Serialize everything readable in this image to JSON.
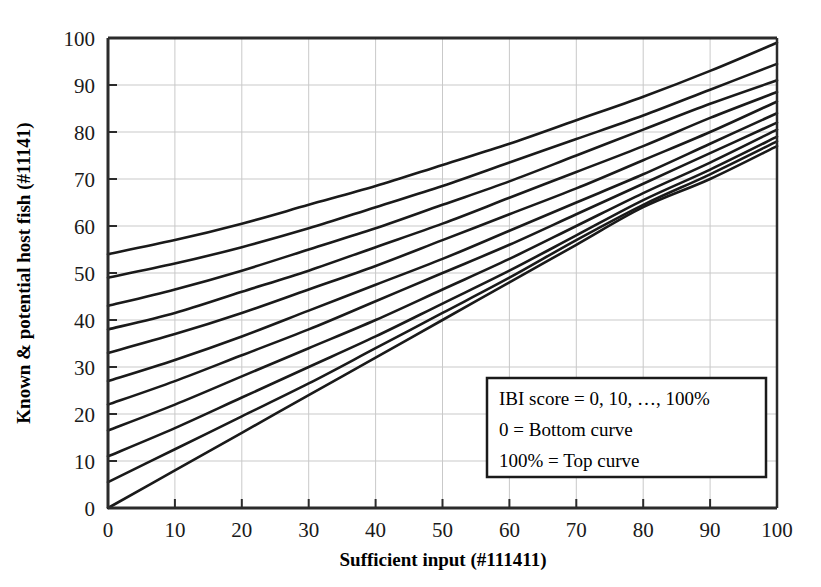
{
  "chart_data": {
    "type": "line",
    "title": "",
    "subtitle": "",
    "xlabel": "Sufficient input (#111411)",
    "ylabel": "Known & potential host fish (#11141)",
    "xlim": [
      0,
      100
    ],
    "ylim": [
      0,
      100
    ],
    "xticks": [
      "0",
      "10",
      "20",
      "30",
      "40",
      "50",
      "60",
      "70",
      "80",
      "90",
      "100"
    ],
    "yticks": [
      "0",
      "10",
      "20",
      "30",
      "40",
      "50",
      "60",
      "70",
      "80",
      "90",
      "100"
    ],
    "grid": true,
    "legend_position": "inside-bottom-right",
    "x": [
      0,
      10,
      20,
      30,
      40,
      50,
      60,
      70,
      80,
      90,
      100
    ],
    "series": [
      {
        "name": "IBI 0%",
        "values": [
          0,
          8,
          16,
          24,
          32,
          40,
          48,
          56,
          64,
          70,
          77
        ]
      },
      {
        "name": "IBI 10%",
        "values": [
          5.5,
          12.5,
          19.5,
          26.5,
          34,
          41.5,
          49,
          57,
          64.5,
          71,
          78
        ]
      },
      {
        "name": "IBI 20%",
        "values": [
          11,
          17,
          23.5,
          30,
          36.5,
          43.5,
          50.5,
          58,
          65.5,
          72,
          79
        ]
      },
      {
        "name": "IBI 30%",
        "values": [
          16.5,
          22,
          28,
          34,
          40,
          46.5,
          53,
          60,
          67,
          73.5,
          80.5
        ]
      },
      {
        "name": "IBI 40%",
        "values": [
          22,
          27,
          32.5,
          38,
          44,
          50,
          56,
          62.5,
          69,
          75.5,
          82
        ]
      },
      {
        "name": "IBI 50%",
        "values": [
          27,
          31.5,
          36.5,
          42,
          47.5,
          53,
          59,
          65,
          71,
          77.5,
          84
        ]
      },
      {
        "name": "IBI 60%",
        "values": [
          33,
          37,
          41.5,
          46.5,
          51.5,
          57,
          62.5,
          68,
          74,
          80,
          86.5
        ]
      },
      {
        "name": "IBI 70%",
        "values": [
          38,
          41.5,
          46,
          50.5,
          55.5,
          60.5,
          66,
          71.5,
          77,
          83,
          88.5
        ]
      },
      {
        "name": "IBI 80%",
        "values": [
          43,
          46.5,
          50.5,
          55,
          59.5,
          64.5,
          69.5,
          75,
          80.5,
          86,
          91
        ]
      },
      {
        "name": "IBI 90%",
        "values": [
          49,
          52,
          55.5,
          59.5,
          64,
          68.5,
          73.5,
          78.5,
          83.5,
          89,
          94.5
        ]
      },
      {
        "name": "IBI 100%",
        "values": [
          54,
          57,
          60.5,
          64.5,
          68.5,
          73,
          77.5,
          82.5,
          87.5,
          93,
          99
        ]
      },
      {
        "name": "Top border 100",
        "values": [
          100,
          100,
          100,
          100,
          100,
          100,
          100,
          100,
          100,
          100,
          100
        ]
      }
    ],
    "legend": {
      "line1": "IBI score = 0, 10, …, 100%",
      "line2": "0 = Bottom curve",
      "line3": "100% = Top curve"
    },
    "colors": {
      "line": "#1a1a1a",
      "axis": "#2b2b2b",
      "grid": "#c9c9c9",
      "background": "#ffffff",
      "text": "#000000"
    }
  }
}
